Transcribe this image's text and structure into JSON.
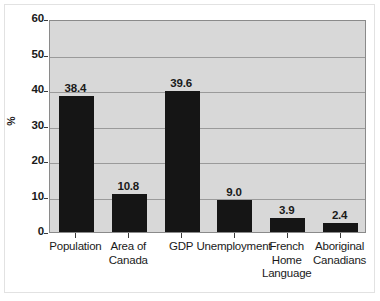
{
  "chart_data": {
    "type": "bar",
    "title": "",
    "subtitle": "",
    "xlabel": "",
    "ylabel": "%",
    "ylim": [
      0,
      60
    ],
    "yticks": [
      0,
      10,
      20,
      30,
      40,
      50,
      60
    ],
    "ytick_labels": [
      "0",
      "10",
      "20",
      "30",
      "40",
      "50",
      "60"
    ],
    "grid": true,
    "legend": "none",
    "categories": [
      "Population",
      "Area of\nCanada",
      "GDP",
      "Unemployment",
      "French\nHome\nLanguage",
      "Aboriginal\nCanadians"
    ],
    "values": [
      38.4,
      10.8,
      39.6,
      9.0,
      3.9,
      2.4
    ],
    "value_labels": [
      "38.4",
      "10.8",
      "39.6",
      "9.0",
      "3.9",
      "2.4"
    ],
    "bar_color": "#151515",
    "plot_background": "#d8d8d8",
    "gridline_color": "#9a9a9a",
    "axis_color": "#8a8a8a"
  }
}
